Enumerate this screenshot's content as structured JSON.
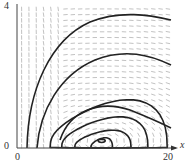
{
  "chart_data": {
    "type": "phase-portrait",
    "title": "",
    "xlabel": "x",
    "ylabel": "",
    "xlim": [
      0,
      20
    ],
    "ylim": [
      0,
      4
    ],
    "x_ticks": [
      "0",
      "20"
    ],
    "y_ticks": [
      "0",
      "4"
    ],
    "grid": false,
    "legend": null,
    "direction_field": true,
    "equilibrium": {
      "x": 11,
      "y": 0.2
    },
    "closed_orbits": [
      {
        "x_range": [
          9.6,
          12.4
        ],
        "y_peak": 0.25
      },
      {
        "x_range": [
          7.5,
          14.8
        ],
        "y_peak": 0.45
      },
      {
        "x_range": [
          5.8,
          17.0
        ],
        "y_peak": 0.8
      },
      {
        "x_range": [
          4.3,
          19.5
        ],
        "y_peak": 1.25
      }
    ],
    "open_trajectories": [
      {
        "start": [
          2.6,
          2.2
        ],
        "end": [
          20,
          0.55
        ]
      },
      {
        "start": [
          1.4,
          3.7
        ],
        "end": [
          20,
          2.1
        ]
      },
      {
        "start": [
          0.5,
          0.0
        ],
        "end": [
          20,
          3.5
        ]
      }
    ],
    "colors": {
      "curves": "#222222",
      "arrows": "#999999",
      "axes": "#333333"
    }
  },
  "labels": {
    "y_top": "4",
    "y_zero": "0",
    "x_zero": "0",
    "x_end": "20",
    "x_axis_name": "x"
  }
}
